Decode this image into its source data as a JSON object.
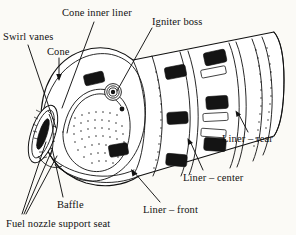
{
  "figure": {
    "background_color": "#fbfaf6",
    "ink_color": "#111111"
  },
  "labels": {
    "swirl_vanes": "Swirl vanes",
    "cone": "Cone",
    "cone_inner_liner": "Cone inner liner",
    "igniter_boss": "Igniter boss",
    "liner_rear": "Liner – rear",
    "liner_center": "Liner – center",
    "liner_front": "Liner – front",
    "baffle": "Baffle",
    "fuel_nozzle_support_seat": "Fuel nozzle support seat"
  },
  "parts": [
    {
      "id": "swirl-vanes",
      "label": "Swirl vanes"
    },
    {
      "id": "cone",
      "label": "Cone"
    },
    {
      "id": "cone-inner-liner",
      "label": "Cone inner liner"
    },
    {
      "id": "igniter-boss",
      "label": "Igniter boss"
    },
    {
      "id": "liner-rear",
      "label": "Liner – rear"
    },
    {
      "id": "liner-center",
      "label": "Liner – center"
    },
    {
      "id": "liner-front",
      "label": "Liner – front"
    },
    {
      "id": "baffle",
      "label": "Baffle"
    },
    {
      "id": "fuel-nozzle-support-seat",
      "label": "Fuel nozzle support seat"
    }
  ]
}
